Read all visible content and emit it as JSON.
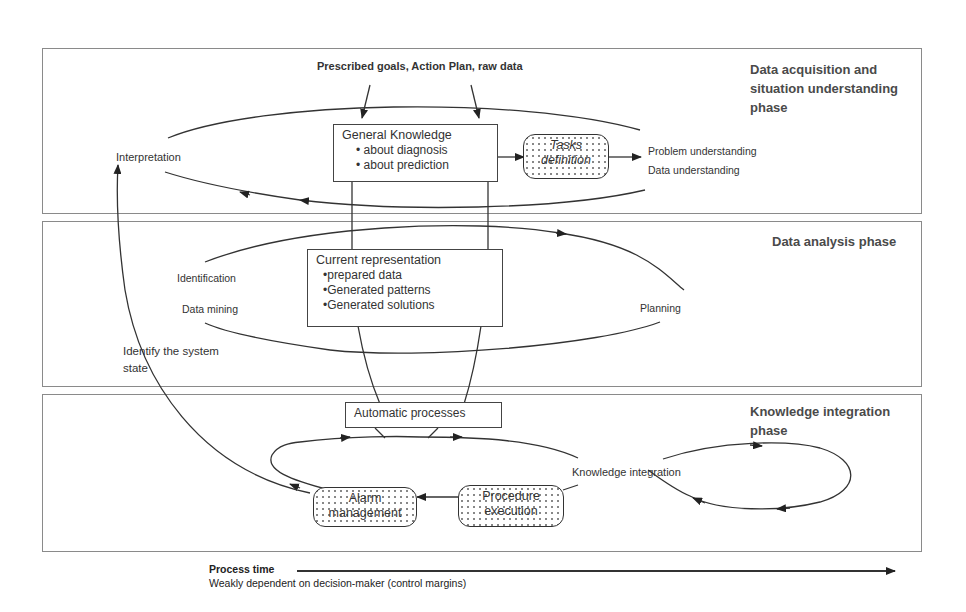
{
  "phases": [
    {
      "id": "acquisition",
      "title_lines": [
        "Data acquisition and",
        "situation understanding",
        "phase"
      ]
    },
    {
      "id": "analysis",
      "title_lines": [
        "Data analysis phase"
      ]
    },
    {
      "id": "integration",
      "title_lines": [
        "Knowledge integration",
        "phase"
      ]
    }
  ],
  "inputs": {
    "label": "Prescribed goals, Action Plan, raw data"
  },
  "general_knowledge": {
    "title": "General Knowledge",
    "items": [
      "• about diagnosis",
      "• about prediction"
    ]
  },
  "tasks_definition": {
    "line1": "Tasks",
    "line2": "definition"
  },
  "acquisition_labels": {
    "interpretation": "Interpretation",
    "problem_understanding": "Problem understanding",
    "data_understanding": "Data understanding"
  },
  "current_representation": {
    "title": "Current representation",
    "items": [
      "•prepared data",
      "•Generated patterns",
      "•Generated solutions"
    ]
  },
  "analysis_labels": {
    "identification": "Identification",
    "data_mining": "Data mining",
    "planning": "Planning",
    "identify_state_line1": "Identify the system",
    "identify_state_line2": "state"
  },
  "automatic_processes": {
    "label": "Automatic processes"
  },
  "integration_labels": {
    "knowledge_integration": "Knowledge integration"
  },
  "alarm_management": {
    "line1": "Alarm",
    "line2": "management"
  },
  "procedure_execution": {
    "line1": "Procedure",
    "line2": "execution"
  },
  "footer": {
    "title": "Process time",
    "subtitle": "Weakly dependent on decision-maker  (control margins)"
  },
  "colors": {
    "line": "#333333",
    "panel_border": "#8a8a8a",
    "phase_title": "#4a4a4a"
  }
}
